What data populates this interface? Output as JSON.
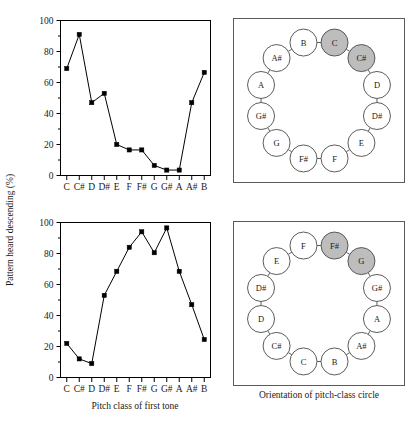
{
  "figure": {
    "y_axis_label": "Pattern heard descending (%)",
    "x_axis_label": "Pitch class of first tone",
    "right_caption": "Orientation of pitch-class circle"
  },
  "chart_data": [
    {
      "type": "line",
      "panel": "top",
      "title": "",
      "xlabel": "Pitch class of first tone",
      "ylabel": "Pattern heard descending (%)",
      "categories": [
        "C",
        "C#",
        "D",
        "D#",
        "E",
        "F",
        "F#",
        "G",
        "G#",
        "A",
        "A#",
        "B"
      ],
      "values": [
        69,
        91,
        47,
        53,
        20,
        16.5,
        16.5,
        6.5,
        3.5,
        3.5,
        47,
        66.5
      ],
      "ylim": [
        0,
        100
      ],
      "yticks": [
        0,
        20,
        40,
        60,
        80,
        100
      ],
      "ytick_labels": [
        "0",
        "20",
        "40",
        "60",
        "80",
        "100"
      ],
      "grid": false,
      "legend": "none",
      "marker": "filled-square"
    },
    {
      "type": "line",
      "panel": "bottom",
      "title": "",
      "xlabel": "Pitch class of first tone",
      "ylabel": "Pattern heard descending (%)",
      "categories": [
        "C",
        "C#",
        "D",
        "D#",
        "E",
        "F",
        "F#",
        "G",
        "G#",
        "A",
        "A#",
        "B"
      ],
      "values": [
        22,
        12,
        9,
        53,
        68.5,
        84,
        94,
        80.5,
        96.5,
        68.5,
        47,
        24.5
      ],
      "ylim": [
        0,
        100
      ],
      "yticks": [
        0,
        20,
        40,
        60,
        80,
        100
      ],
      "ytick_labels": [
        "0",
        "20",
        "40",
        "60",
        "80",
        "100"
      ],
      "grid": false,
      "legend": "none",
      "marker": "filled-square"
    }
  ],
  "circles": [
    {
      "panel": "top",
      "start_angle_deg": -75,
      "nodes": [
        {
          "label": "C",
          "shaded": true
        },
        {
          "label": "C#",
          "shaded": true
        },
        {
          "label": "D",
          "shaded": false
        },
        {
          "label": "D#",
          "shaded": false
        },
        {
          "label": "E",
          "shaded": false
        },
        {
          "label": "F",
          "shaded": false
        },
        {
          "label": "F#",
          "shaded": false
        },
        {
          "label": "G",
          "shaded": false
        },
        {
          "label": "G#",
          "shaded": false
        },
        {
          "label": "A",
          "shaded": false
        },
        {
          "label": "A#",
          "shaded": false
        },
        {
          "label": "B",
          "shaded": false
        }
      ]
    },
    {
      "panel": "bottom",
      "start_angle_deg": -75,
      "nodes": [
        {
          "label": "F#",
          "shaded": true
        },
        {
          "label": "G",
          "shaded": true
        },
        {
          "label": "G#",
          "shaded": false
        },
        {
          "label": "A",
          "shaded": false
        },
        {
          "label": "A#",
          "shaded": false
        },
        {
          "label": "B",
          "shaded": false
        },
        {
          "label": "C",
          "shaded": false
        },
        {
          "label": "C#",
          "shaded": false
        },
        {
          "label": "D",
          "shaded": false
        },
        {
          "label": "D#",
          "shaded": false
        },
        {
          "label": "E",
          "shaded": false
        },
        {
          "label": "F",
          "shaded": false
        }
      ]
    }
  ],
  "colors": {
    "line": "#000000",
    "marker": "#000000",
    "frame": "#000000",
    "panel_border": "#5a5a5a",
    "node_fill": "#ffffff",
    "node_shaded_fill": "#bdbdbd",
    "text": "#1a1a1a"
  }
}
